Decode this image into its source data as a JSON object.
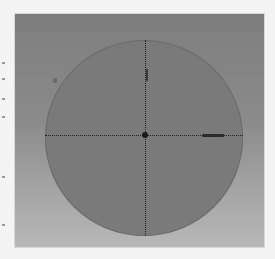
{
  "widget": {
    "type": "circular-crosshair-view",
    "colors": {
      "page_background": "#f4f4f4",
      "frame_top": "#7e7e7e",
      "frame_bottom": "#b8b8b8",
      "dish": "#7a7a7a",
      "crosshair": "#1e1e1e",
      "pointer": "#2a2a2a"
    },
    "crosshair": {
      "horizontal": true,
      "vertical": true,
      "style": "dotted"
    },
    "markers": [
      {
        "name": "center-dot"
      },
      {
        "name": "north-tick"
      },
      {
        "name": "east-pointer"
      }
    ]
  }
}
